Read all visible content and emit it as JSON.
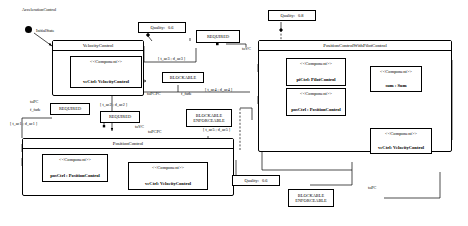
{
  "diagram": {
    "title": "AccelerationControl",
    "initial_state_label": "InitialState",
    "type": "uml-component-statechart"
  },
  "regions": [
    {
      "id": "velocity_control",
      "title": "VelocityControl"
    },
    {
      "id": "position_control_with_pilot_control",
      "title": "PositionControlWithPilotControl"
    },
    {
      "id": "position_control",
      "title": "PositionControl"
    }
  ],
  "components": [
    {
      "id": "vc_vcctrl",
      "stereotype": "<<Component>>",
      "name": "vcCtrl: VelocityControl"
    },
    {
      "id": "pcpc_pictrl",
      "stereotype": "<<Component>>",
      "name": "piCtrl: PilotControl"
    },
    {
      "id": "pcpc_posctrl",
      "stereotype": "<<Component>>",
      "name": "posCtrl : PositionControl"
    },
    {
      "id": "pcpc_sum",
      "stereotype": "<<Component>>",
      "name": "sum : Sum"
    },
    {
      "id": "pcpc_vcctrl",
      "stereotype": "<<Component>>",
      "name": "vcCtrl: VelocityControl"
    },
    {
      "id": "pc_posctrl",
      "stereotype": "<<Component>>",
      "name": "posCtrl : PositionControl"
    },
    {
      "id": "pc_vcctrl",
      "stereotype": "<<Component>>",
      "name": "vcCtrl: VelocityControl"
    }
  ],
  "quality_annotations": [
    {
      "id": "quality_top_left",
      "label": "Quality:",
      "value": "0.6"
    },
    {
      "id": "quality_top_right",
      "label": "Quality:",
      "value": "0.8"
    },
    {
      "id": "quality_bottom",
      "label": "Quality:",
      "value": "0.6"
    }
  ],
  "stereotype_boxes": [
    {
      "id": "required_top",
      "text": "REQUIRED"
    },
    {
      "id": "required_left",
      "text": "REQUIRED"
    },
    {
      "id": "required_mid",
      "text": "REQUIRED"
    },
    {
      "id": "blockable_top",
      "text": "BLOCKABLE"
    },
    {
      "id": "blockable_enforceable_mid",
      "line1": "BLOCKABLE",
      "line2": "ENFORCEABLE"
    },
    {
      "id": "blockable_enforceable_bottom",
      "line1": "BLOCKABLE",
      "line2": "ENFORCEABLE"
    }
  ],
  "transition_labels": [
    {
      "id": "t_ac1",
      "text": "[ t_ac1 ; d_ac1 ]"
    },
    {
      "id": "t_ac2",
      "text": "[ t_ac2 ; d_ac2 ]"
    },
    {
      "id": "t_ac3",
      "text": "[ t_ac3 ; d_ac3 ]"
    },
    {
      "id": "t_ac4",
      "text": "[ t_ac4 ; d_ac4 ]"
    },
    {
      "id": "t_ac5",
      "text": "[ t_ac5 ; d_ac5 ]"
    }
  ],
  "port_labels": [
    {
      "id": "to_pc",
      "text": "toPC"
    },
    {
      "id": "f_fade_left",
      "text": "f_fade"
    },
    {
      "id": "to_vc_top",
      "text": "toVC"
    },
    {
      "id": "to_vc_mid",
      "text": "toVC"
    },
    {
      "id": "to_pcpc_top",
      "text": "toPCPC"
    },
    {
      "id": "f_fade_top",
      "text": "f_fade"
    },
    {
      "id": "to_pcpc_mid",
      "text": "toPCPC"
    },
    {
      "id": "to_pc_bottom",
      "text": "toPC"
    }
  ],
  "colors": {
    "stroke": "#000000",
    "background": "#ffffff",
    "annotation_fill": "#ffffff"
  }
}
